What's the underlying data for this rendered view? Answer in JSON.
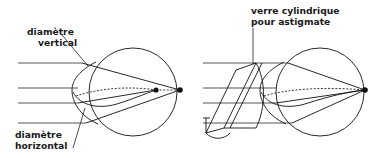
{
  "figure": {
    "background_color": "#ffffff",
    "ink_color": "#111111",
    "ray_color": "#555555",
    "width": 390,
    "height": 158
  },
  "labels": {
    "vertical_diameter_line1": "diamètre",
    "vertical_diameter_line2": "vertical",
    "horizontal_diameter_line1": "diamètre",
    "horizontal_diameter_line2": "horizontal",
    "cylindrical_lens_line1": "verre cylindrique",
    "cylindrical_lens_line2": "pour astigmate"
  },
  "panels": [
    {
      "name": "uncorrected-astigmatic-eye",
      "description": "Oeil astigmate non corrigé : deux foyers distincts",
      "eye_center_x": 133,
      "eye_center_y": 92,
      "eye_radius": 44,
      "focal_points": [
        {
          "name": "focus-vertical-meridian",
          "x": 156,
          "y": 90,
          "radius": 2.6
        },
        {
          "name": "focus-horizontal-meridian",
          "x": 180,
          "y": 90,
          "radius": 2.6
        }
      ],
      "incoming_rays_y": [
        63,
        88,
        103,
        123
      ],
      "ray_start_x": 18,
      "ray_end_x": 80
    },
    {
      "name": "corrected-astigmatic-eye",
      "description": "Oeil astigmate corrigé par verre cylindrique : foyer unique",
      "eye_center_x": 320,
      "eye_center_y": 92,
      "eye_radius": 44,
      "focal_points": [
        {
          "name": "focus-single-corrected",
          "x": 365,
          "y": 90,
          "radius": 2.8
        }
      ],
      "incoming_rays_y": [
        63,
        88,
        103,
        123
      ],
      "ray_start_x": 203,
      "ray_end_x": 268,
      "cylindrical_lens": {
        "name": "cylindrical-lens-prism",
        "leader_line_x": 253,
        "leader_top_y": 28,
        "leader_bottom_y": 64
      }
    }
  ]
}
